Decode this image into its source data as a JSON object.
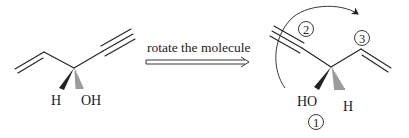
{
  "figure": {
    "type": "stereochemistry-rotation-diagram",
    "left_molecule": {
      "name": "starting-molecule",
      "labels": {
        "h": "H",
        "oh": "OH"
      },
      "groups": [
        "vinyl",
        "ethynyl",
        "H (wedge)",
        "OH (hash)"
      ]
    },
    "reaction_arrow": {
      "label": "rotate the molecule",
      "style": "open double-line arrow"
    },
    "right_molecule": {
      "name": "rotated-molecule",
      "labels": {
        "ho": "HO",
        "h": "H"
      },
      "groups": [
        "ethynyl",
        "vinyl",
        "OH (wedge)",
        "H (hash)"
      ],
      "priorities": [
        {
          "rank": "1",
          "group": "OH"
        },
        {
          "rank": "2",
          "group": "ethynyl"
        },
        {
          "rank": "3",
          "group": "vinyl"
        }
      ],
      "rotation_direction": "clockwise"
    },
    "colors": {
      "ink": "#222222",
      "background": "#ffffff"
    }
  }
}
